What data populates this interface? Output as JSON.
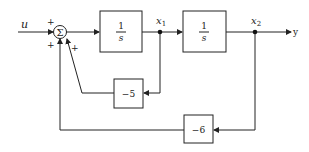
{
  "diagram": {
    "type": "block-diagram",
    "input_label": "u",
    "output_label": "y",
    "summing_junction": {
      "symbol": "Σ",
      "signs": [
        "+",
        "+",
        "+"
      ]
    },
    "blocks": [
      {
        "id": "integrator-1",
        "numerator": "1",
        "denominator": "s"
      },
      {
        "id": "integrator-2",
        "numerator": "1",
        "denominator": "s"
      },
      {
        "id": "gain-inner",
        "label": "−5"
      },
      {
        "id": "gain-outer",
        "label": "−6"
      }
    ],
    "signals": {
      "x1": {
        "base": "x",
        "sub": "1"
      },
      "x2": {
        "base": "x",
        "sub": "2"
      }
    },
    "colors": {
      "line": "#222222",
      "background": "#ffffff"
    }
  }
}
